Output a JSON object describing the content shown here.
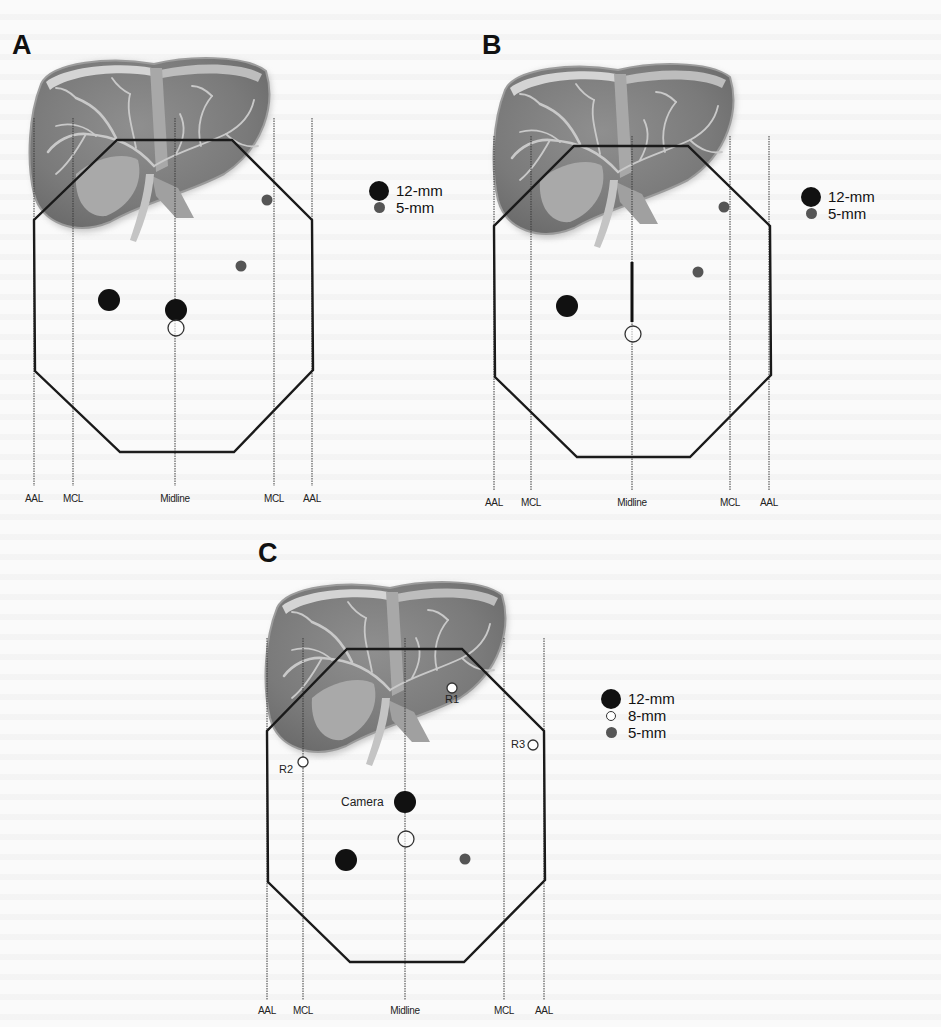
{
  "figure": {
    "panels": [
      {
        "id": "A",
        "letter": "A",
        "letter_pos": [
          12,
          30
        ],
        "liver": {
          "x": 26,
          "y": 56,
          "w": 250,
          "h": 200
        },
        "lines": {
          "y_top": 118,
          "y_bottom": 486,
          "positions": [
            34,
            73,
            175,
            274,
            312
          ],
          "labels": [
            "AAL",
            "MCL",
            "Midline",
            "MCL",
            "AAL"
          ],
          "label_y": 493
        },
        "octagon": [
          [
            117,
            140
          ],
          [
            232,
            140
          ],
          [
            312,
            220
          ],
          [
            313,
            370
          ],
          [
            234,
            452
          ],
          [
            120,
            452
          ],
          [
            35,
            371
          ],
          [
            34,
            220
          ]
        ],
        "markers": [
          {
            "type": "5mm",
            "x": 267,
            "y": 200
          },
          {
            "type": "5mm",
            "x": 241,
            "y": 266
          },
          {
            "type": "12mm",
            "x": 109,
            "y": 300
          },
          {
            "type": "12mm",
            "x": 176,
            "y": 310
          },
          {
            "type": "open",
            "x": 176,
            "y": 328
          }
        ],
        "thick_segment": null,
        "legend": {
          "x": 368,
          "y": 182,
          "items": [
            "12-mm",
            "5-mm"
          ]
        }
      },
      {
        "id": "B",
        "letter": "B",
        "letter_pos": [
          482,
          30
        ],
        "liver": {
          "x": 490,
          "y": 62,
          "w": 250,
          "h": 200
        },
        "lines": {
          "y_top": 136,
          "y_bottom": 490,
          "positions": [
            494,
            531,
            632,
            730,
            769
          ],
          "labels": [
            "AAL",
            "MCL",
            "Midline",
            "MCL",
            "AAL"
          ],
          "label_y": 497
        },
        "octagon": [
          [
            574,
            146
          ],
          [
            688,
            146
          ],
          [
            770,
            226
          ],
          [
            771,
            375
          ],
          [
            690,
            457
          ],
          [
            577,
            457
          ],
          [
            495,
            377
          ],
          [
            494,
            226
          ]
        ],
        "markers": [
          {
            "type": "5mm",
            "x": 724,
            "y": 207
          },
          {
            "type": "5mm",
            "x": 698,
            "y": 272
          },
          {
            "type": "12mm",
            "x": 567,
            "y": 306
          },
          {
            "type": "open",
            "x": 633,
            "y": 334
          }
        ],
        "thick_segment": {
          "x": 632,
          "y1": 262,
          "y2": 322
        },
        "legend": {
          "x": 800,
          "y": 188,
          "items": [
            "12-mm",
            "5-mm"
          ]
        }
      },
      {
        "id": "C",
        "letter": "C",
        "letter_pos": [
          258,
          538
        ],
        "liver": {
          "x": 262,
          "y": 580,
          "w": 250,
          "h": 200
        },
        "lines": {
          "y_top": 638,
          "y_bottom": 1000,
          "positions": [
            267,
            303,
            405,
            504,
            544
          ],
          "labels": [
            "AAL",
            "MCL",
            "Midline",
            "MCL",
            "AAL"
          ],
          "label_y": 1005
        },
        "octagon": [
          [
            347,
            649
          ],
          [
            462,
            649
          ],
          [
            544,
            731
          ],
          [
            545,
            880
          ],
          [
            464,
            962
          ],
          [
            350,
            962
          ],
          [
            268,
            882
          ],
          [
            267,
            731
          ]
        ],
        "markers": [
          {
            "type": "8mm",
            "x": 452,
            "y": 688,
            "label": "R1",
            "label_pos": "below"
          },
          {
            "type": "8mm",
            "x": 303,
            "y": 762,
            "label": "R2",
            "label_pos": "left-below"
          },
          {
            "type": "8mm",
            "x": 533,
            "y": 745,
            "label": "R3",
            "label_pos": "left"
          },
          {
            "type": "12mm",
            "x": 405,
            "y": 802,
            "label": "Camera",
            "label_pos": "left"
          },
          {
            "type": "open",
            "x": 406,
            "y": 839
          },
          {
            "type": "12mm",
            "x": 346,
            "y": 860
          },
          {
            "type": "5mm",
            "x": 465,
            "y": 859
          }
        ],
        "thick_segment": null,
        "legend": {
          "x": 600,
          "y": 690,
          "items": [
            "12-mm",
            "8-mm",
            "5-mm"
          ]
        }
      }
    ],
    "marker_styles": {
      "12mm": {
        "diameter": 22,
        "fill": "#111111",
        "stroke": "none"
      },
      "5mm": {
        "diameter": 11,
        "fill": "#555555",
        "stroke": "none"
      },
      "8mm": {
        "diameter": 10,
        "fill": "#ffffff",
        "stroke": "#333333"
      },
      "open": {
        "diameter": 16,
        "fill": "none",
        "stroke": "#333333"
      }
    },
    "legend_labels": {
      "12-mm": "12-mm",
      "8-mm": "8-mm",
      "5-mm": "5-mm"
    },
    "colors": {
      "background": "#fafafa",
      "outline": "#1a1a1a",
      "liver_dark": "#7a7a7a",
      "liver_mid": "#8c8c8c",
      "liver_light": "#b8b8b8",
      "vessel": "#c9c9c9",
      "gallbladder": "#a9a9a9"
    }
  }
}
